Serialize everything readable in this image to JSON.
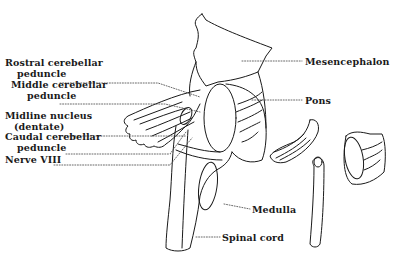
{
  "diagram": {
    "type": "anatomical line drawing",
    "colors": {
      "line": "#1a1a1a",
      "background": "#ffffff",
      "leader": "#444444"
    },
    "labels_left": [
      {
        "id": "rostral",
        "line1": "Rostral cerebellar",
        "line2": "peduncle"
      },
      {
        "id": "middle",
        "line1": "Middle cerebellar",
        "line2": "peduncle"
      },
      {
        "id": "midline",
        "line1": "Midline nucleus",
        "line2": "(dentate)"
      },
      {
        "id": "caudal",
        "line1": "Caudal cerebellar",
        "line2": "peduncle"
      },
      {
        "id": "nerve",
        "line1": "Nerve VIII"
      }
    ],
    "labels_right": [
      {
        "id": "mesencephalon",
        "text": "Mesencephalon"
      },
      {
        "id": "pons",
        "text": "Pons"
      },
      {
        "id": "medulla",
        "text": "Medulla"
      },
      {
        "id": "spinal",
        "text": "Spinal cord"
      }
    ]
  }
}
